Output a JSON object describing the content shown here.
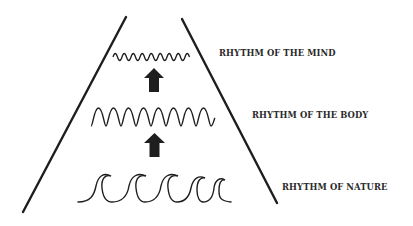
{
  "diagram": {
    "title": "",
    "colors": {
      "line": "#1e1e1e",
      "text": "#2a2a2a",
      "background": "#ffffff"
    },
    "levels": [
      {
        "id": "mind",
        "label": "RHYTHM OF THE MIND",
        "wave_type": "small-sine",
        "peaks": 9
      },
      {
        "id": "body",
        "label": "RHYTHM OF THE BODY",
        "wave_type": "large-sine",
        "peaks": 8
      },
      {
        "id": "nature",
        "label": "RHYTHM OF NATURE",
        "wave_type": "ocean-curl",
        "peaks": 6
      }
    ],
    "arrows": [
      {
        "from": "nature",
        "to": "body",
        "icon": "arrow-up-icon"
      },
      {
        "from": "body",
        "to": "mind",
        "icon": "arrow-up-icon"
      }
    ]
  }
}
